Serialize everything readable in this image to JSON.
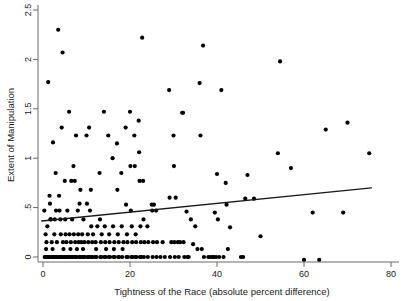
{
  "chart_data": {
    "type": "scatter",
    "title": "",
    "xlabel": "Tightness of the Race (absolute percent difference)",
    "ylabel": "Extent of Manipulation",
    "xlim": [
      -1.5,
      80
    ],
    "ylim": [
      -0.07,
      2.55
    ],
    "xticks": [
      0,
      20,
      40,
      60,
      80
    ],
    "xticklabels": [
      "0",
      "20",
      "40",
      "60",
      "80"
    ],
    "yticks": [
      0,
      0.5,
      1,
      1.5,
      2,
      2.5
    ],
    "yticklabels": [
      "0",
      ".5",
      "1",
      "1.5",
      "2",
      "2.5"
    ],
    "grid": false,
    "legend": null,
    "series": [
      {
        "name": "observations",
        "marker": "filled-circle",
        "marker_color": "#000000",
        "points": [
          [
            0.3,
            0.47
          ],
          [
            0.4,
            0.0
          ],
          [
            0.5,
            0.0
          ],
          [
            0.6,
            0.23
          ],
          [
            0.7,
            0.08
          ],
          [
            0.8,
            0.15
          ],
          [
            0.9,
            0.0
          ],
          [
            1.0,
            0.31
          ],
          [
            1.1,
            0.0
          ],
          [
            1.2,
            1.77
          ],
          [
            1.3,
            0.0
          ],
          [
            1.4,
            0.0
          ],
          [
            1.5,
            0.62
          ],
          [
            1.6,
            0.54
          ],
          [
            1.7,
            0.38
          ],
          [
            1.8,
            0.38
          ],
          [
            1.9,
            0.0
          ],
          [
            2.0,
            0.15
          ],
          [
            2.1,
            0.0
          ],
          [
            2.2,
            0.08
          ],
          [
            2.3,
            1.16
          ],
          [
            2.4,
            0.0
          ],
          [
            2.5,
            0.0
          ],
          [
            2.6,
            0.23
          ],
          [
            2.7,
            0.38
          ],
          [
            2.8,
            0.0
          ],
          [
            2.9,
            0.85
          ],
          [
            3.0,
            0.47
          ],
          [
            3.1,
            0.0
          ],
          [
            3.2,
            0.15
          ],
          [
            3.3,
            0.0
          ],
          [
            3.4,
            0.0
          ],
          [
            3.5,
            2.3
          ],
          [
            3.6,
            0.0
          ],
          [
            3.7,
            0.62
          ],
          [
            3.8,
            0.47
          ],
          [
            3.9,
            0.0
          ],
          [
            4.0,
            0.38
          ],
          [
            4.1,
            0.23
          ],
          [
            4.2,
            0.0
          ],
          [
            4.3,
            1.31
          ],
          [
            4.4,
            0.0
          ],
          [
            4.5,
            2.07
          ],
          [
            4.6,
            0.15
          ],
          [
            4.7,
            0.08
          ],
          [
            4.8,
            0.0
          ],
          [
            4.9,
            0.0
          ],
          [
            5.0,
            0.77
          ],
          [
            5.1,
            0.38
          ],
          [
            5.2,
            0.23
          ],
          [
            5.3,
            0.0
          ],
          [
            5.4,
            0.15
          ],
          [
            5.5,
            0.0
          ],
          [
            5.6,
            0.47
          ],
          [
            5.7,
            0.0
          ],
          [
            5.8,
            0.0
          ],
          [
            6.0,
            1.47
          ],
          [
            6.1,
            0.23
          ],
          [
            6.2,
            0.0
          ],
          [
            6.3,
            0.08
          ],
          [
            6.4,
            0.15
          ],
          [
            6.5,
            0.77
          ],
          [
            6.6,
            0.0
          ],
          [
            6.7,
            0.38
          ],
          [
            6.8,
            0.0
          ],
          [
            7.0,
            0.92
          ],
          [
            7.1,
            0.23
          ],
          [
            7.2,
            0.0
          ],
          [
            7.3,
            0.77
          ],
          [
            7.4,
            0.15
          ],
          [
            7.5,
            0.0
          ],
          [
            7.6,
            1.23
          ],
          [
            7.7,
            0.0
          ],
          [
            7.8,
            0.08
          ],
          [
            8.0,
            0.47
          ],
          [
            8.1,
            0.23
          ],
          [
            8.2,
            0.15
          ],
          [
            8.3,
            0.0
          ],
          [
            8.4,
            0.54
          ],
          [
            8.5,
            0.0
          ],
          [
            8.6,
            0.68
          ],
          [
            8.7,
            0.0
          ],
          [
            8.8,
            0.15
          ],
          [
            9.0,
            0.23
          ],
          [
            9.1,
            0.0
          ],
          [
            9.2,
            0.08
          ],
          [
            9.3,
            0.38
          ],
          [
            9.4,
            0.0
          ],
          [
            9.5,
            0.15
          ],
          [
            9.6,
            0.0
          ],
          [
            10.0,
            1.23
          ],
          [
            10.1,
            0.54
          ],
          [
            10.2,
            0.0
          ],
          [
            10.3,
            0.23
          ],
          [
            10.4,
            0.15
          ],
          [
            10.5,
            0.0
          ],
          [
            10.6,
            1.31
          ],
          [
            10.7,
            0.0
          ],
          [
            10.8,
            0.47
          ],
          [
            11.0,
            0.68
          ],
          [
            11.1,
            0.31
          ],
          [
            11.2,
            0.0
          ],
          [
            11.3,
            0.15
          ],
          [
            11.4,
            0.0
          ],
          [
            11.5,
            0.23
          ],
          [
            12.0,
            0.0
          ],
          [
            12.1,
            0.15
          ],
          [
            12.2,
            0.08
          ],
          [
            12.3,
            0.0
          ],
          [
            12.5,
            0.31
          ],
          [
            13.0,
            0.85
          ],
          [
            13.1,
            0.38
          ],
          [
            13.2,
            0.0
          ],
          [
            13.3,
            0.15
          ],
          [
            13.4,
            0.0
          ],
          [
            13.5,
            0.23
          ],
          [
            14.0,
            1.47
          ],
          [
            14.1,
            0.0
          ],
          [
            14.2,
            0.31
          ],
          [
            14.3,
            0.15
          ],
          [
            14.4,
            0.0
          ],
          [
            14.5,
            0.08
          ],
          [
            15.0,
            1.23
          ],
          [
            15.1,
            0.0
          ],
          [
            15.2,
            0.23
          ],
          [
            15.3,
            0.15
          ],
          [
            15.4,
            0.0
          ],
          [
            16.0,
            1.0
          ],
          [
            16.1,
            0.31
          ],
          [
            16.2,
            0.0
          ],
          [
            16.3,
            0.08
          ],
          [
            16.4,
            0.15
          ],
          [
            16.5,
            0.0
          ],
          [
            17.0,
            1.15
          ],
          [
            17.1,
            0.68
          ],
          [
            17.2,
            0.23
          ],
          [
            17.3,
            0.0
          ],
          [
            17.4,
            0.15
          ],
          [
            17.5,
            0.0
          ],
          [
            18.0,
            0.85
          ],
          [
            18.1,
            0.31
          ],
          [
            18.2,
            0.0
          ],
          [
            18.3,
            0.08
          ],
          [
            18.5,
            0.15
          ],
          [
            19.0,
            1.31
          ],
          [
            19.1,
            0.53
          ],
          [
            19.2,
            0.0
          ],
          [
            19.3,
            0.23
          ],
          [
            19.4,
            0.15
          ],
          [
            19.5,
            0.0
          ],
          [
            20.0,
            1.47
          ],
          [
            20.1,
            0.92
          ],
          [
            20.2,
            0.47
          ],
          [
            20.3,
            0.0
          ],
          [
            20.4,
            0.31
          ],
          [
            20.5,
            0.15
          ],
          [
            20.6,
            0.0
          ],
          [
            21.0,
            1.23
          ],
          [
            21.1,
            0.92
          ],
          [
            21.2,
            0.0
          ],
          [
            21.3,
            0.23
          ],
          [
            21.4,
            0.15
          ],
          [
            21.5,
            0.0
          ],
          [
            22.0,
            1.38
          ],
          [
            22.1,
            1.06
          ],
          [
            22.2,
            0.77
          ],
          [
            22.3,
            0.0
          ],
          [
            22.4,
            0.31
          ],
          [
            22.5,
            0.15
          ],
          [
            22.6,
            0.0
          ],
          [
            22.8,
            2.22
          ],
          [
            23.0,
            0.77
          ],
          [
            23.1,
            0.38
          ],
          [
            23.2,
            0.0
          ],
          [
            23.3,
            0.15
          ],
          [
            24.0,
            0.31
          ],
          [
            24.1,
            0.0
          ],
          [
            24.2,
            0.15
          ],
          [
            25.0,
            0.53
          ],
          [
            25.1,
            0.47
          ],
          [
            25.2,
            0.0
          ],
          [
            25.3,
            0.15
          ],
          [
            25.5,
            0.53
          ],
          [
            26.0,
            0.47
          ],
          [
            26.1,
            0.0
          ],
          [
            26.2,
            0.15
          ],
          [
            27.0,
            0.0
          ],
          [
            27.5,
            0.15
          ],
          [
            28.0,
            0.0
          ],
          [
            29.0,
            1.69
          ],
          [
            29.1,
            0.6
          ],
          [
            29.2,
            0.0
          ],
          [
            29.5,
            0.15
          ],
          [
            30.0,
            1.23
          ],
          [
            30.1,
            0.92
          ],
          [
            30.2,
            0.15
          ],
          [
            30.3,
            0.0
          ],
          [
            30.5,
            0.6
          ],
          [
            31.0,
            0.15
          ],
          [
            31.2,
            0.0
          ],
          [
            31.5,
            0.15
          ],
          [
            32.0,
            1.46
          ],
          [
            32.2,
            1.46
          ],
          [
            32.3,
            0.15
          ],
          [
            32.5,
            0.0
          ],
          [
            33.0,
            0.46
          ],
          [
            33.2,
            0.0
          ],
          [
            33.5,
            0.0
          ],
          [
            34.0,
            0.38
          ],
          [
            34.5,
            0.13
          ],
          [
            35.0,
            0.31
          ],
          [
            35.5,
            0.08
          ],
          [
            36.0,
            1.76
          ],
          [
            36.2,
            1.23
          ],
          [
            36.5,
            0.08
          ],
          [
            36.8,
            2.14
          ],
          [
            37.0,
            0.0
          ],
          [
            38.0,
            0.0
          ],
          [
            38.5,
            0.0
          ],
          [
            39.0,
            0.0
          ],
          [
            39.3,
            0.0
          ],
          [
            39.5,
            0.45
          ],
          [
            39.8,
            0.0
          ],
          [
            40.0,
            0.84
          ],
          [
            40.2,
            0.38
          ],
          [
            40.5,
            0.0
          ],
          [
            41.0,
            1.69
          ],
          [
            41.5,
            0.0
          ],
          [
            42.0,
            0.75
          ],
          [
            42.2,
            0.53
          ],
          [
            42.5,
            0.08
          ],
          [
            43.0,
            0.3
          ],
          [
            45.5,
            0.0
          ],
          [
            46.0,
            0.0
          ],
          [
            46.5,
            0.59
          ],
          [
            47.0,
            0.83
          ],
          [
            48.5,
            0.59
          ],
          [
            50.0,
            0.21
          ],
          [
            54.0,
            1.05
          ],
          [
            54.5,
            1.98
          ],
          [
            57.0,
            0.9
          ],
          [
            60.0,
            -0.03
          ],
          [
            62.0,
            0.45
          ],
          [
            63.5,
            -0.03
          ],
          [
            65.0,
            1.29
          ],
          [
            69.0,
            0.45
          ],
          [
            70.0,
            1.36
          ],
          [
            75.0,
            1.05
          ]
        ]
      }
    ],
    "fit_line": {
      "name": "linear fit",
      "color": "#1a1a1a",
      "x_start": -0.3,
      "y_start": 0.365,
      "x_end": 75.5,
      "y_end": 0.7
    }
  }
}
